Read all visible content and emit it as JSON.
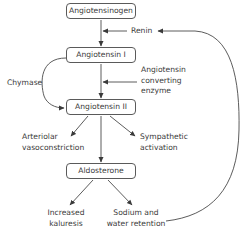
{
  "diagram": {
    "nodes": {
      "angiotensinogen": "Angiotensinogen",
      "angiotensin_1": "Angiotensin I",
      "angiotensin_2": "Angiotensin II",
      "aldosterone": "Aldosterone"
    },
    "enzymes": {
      "renin": "Renin",
      "ace_line1": "Angiotensin",
      "ace_line2": "converting",
      "ace_line3": "enzyme",
      "chymase": "Chymase"
    },
    "effects": {
      "arteriolar_line1": "Arteriolar",
      "arteriolar_line2": "vasoconstriction",
      "sympathetic_line1": "Sympathetic",
      "sympathetic_line2": "activation",
      "kaluresis_line1": "Increased",
      "kaluresis_line2": "kaluresis",
      "sodium_line1": "Sodium and",
      "sodium_line2": "water retention"
    },
    "edges": [
      {
        "from": "Angiotensinogen",
        "to": "Angiotensin I",
        "via": "Renin"
      },
      {
        "from": "Angiotensin I",
        "to": "Angiotensin II",
        "via": "Angiotensin converting enzyme"
      },
      {
        "from": "Angiotensin I",
        "to": "Angiotensin II",
        "via": "Chymase"
      },
      {
        "from": "Angiotensin II",
        "to": "Arteriolar vasoconstriction"
      },
      {
        "from": "Angiotensin II",
        "to": "Sympathetic activation"
      },
      {
        "from": "Angiotensin II",
        "to": "Aldosterone"
      },
      {
        "from": "Aldosterone",
        "to": "Increased kaluresis"
      },
      {
        "from": "Aldosterone",
        "to": "Sodium and water retention"
      },
      {
        "from": "Sodium and water retention",
        "to": "Renin",
        "type": "feedback"
      }
    ],
    "colors": {
      "line": "#4a4a4a",
      "text": "#3a3a3a",
      "background": "#ffffff"
    }
  }
}
